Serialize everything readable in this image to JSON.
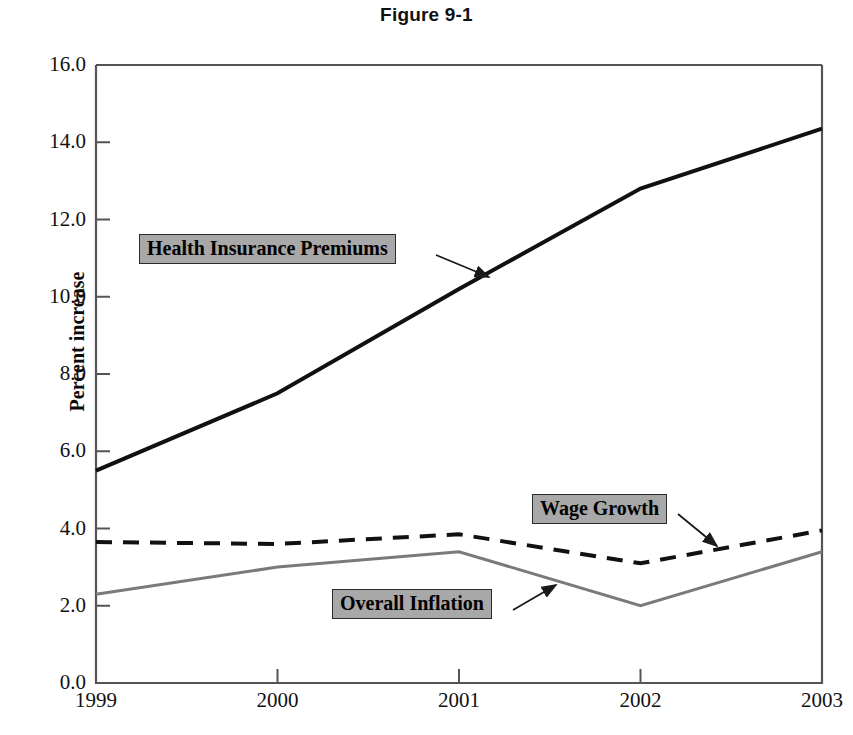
{
  "title": "Figure 9-1",
  "chart_data": {
    "type": "line",
    "title": "Figure 9-1",
    "xlabel": "",
    "ylabel": "Percent increase",
    "x": [
      1999,
      2000,
      2001,
      2002,
      2003
    ],
    "xtick_labels": [
      "1999",
      "2000",
      "2001",
      "2002",
      "2003"
    ],
    "ytick_labels": [
      "0.0",
      "2.0",
      "4.0",
      "6.0",
      "8.0",
      "10.0",
      "12.0",
      "14.0",
      "16.0"
    ],
    "yticks": [
      0.0,
      2.0,
      4.0,
      6.0,
      8.0,
      10.0,
      12.0,
      14.0,
      16.0
    ],
    "ylim": [
      0.0,
      16.0
    ],
    "xlim": [
      1999,
      2003
    ],
    "grid": false,
    "legend_position": "inline-annotations",
    "series": [
      {
        "name": "Health Insurance Premiums",
        "values": [
          5.5,
          7.5,
          10.2,
          12.8,
          14.35
        ],
        "color": "#111111",
        "style": "solid",
        "width": 4
      },
      {
        "name": "Wage Growth",
        "values": [
          3.65,
          3.6,
          3.85,
          3.1,
          3.95
        ],
        "color": "#111111",
        "style": "dashed",
        "width": 4
      },
      {
        "name": "Overall Inflation",
        "values": [
          2.3,
          3.0,
          3.4,
          2.0,
          3.4
        ],
        "color": "#7a7a7a",
        "style": "solid",
        "width": 3
      }
    ],
    "annotations": [
      {
        "text": "Health Insurance Premiums",
        "series": "Health Insurance Premiums"
      },
      {
        "text": "Wage Growth",
        "series": "Wage Growth"
      },
      {
        "text": "Overall Inflation",
        "series": "Overall Inflation"
      }
    ]
  },
  "colors": {
    "axis": "#555555",
    "label_box_fill": "#a8a8a8",
    "label_box_border": "#2b2b2b",
    "text": "#111111"
  }
}
